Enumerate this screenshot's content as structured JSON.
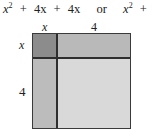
{
  "equation": {
    "term1_base": "x",
    "term1_exp": "2",
    "plus1": "+",
    "term2": "4x",
    "plus2": "+",
    "term3": "4x",
    "connector": "or",
    "alt_term1_base": "x",
    "alt_term1_exp": "2",
    "alt_plus": "+",
    "alt_term2": "8x"
  },
  "top_labels": [
    "x",
    "4"
  ],
  "side_labels": [
    "x",
    "4"
  ],
  "regions": [
    {
      "name": "x-by-x",
      "color": "#8c8c8c"
    },
    {
      "name": "x-by-4",
      "color": "#b9b9b9"
    },
    {
      "name": "4-by-x",
      "color": "#bcbcbc"
    },
    {
      "name": "4-by-4",
      "color": "#d9d9d9"
    }
  ],
  "border_color": "#2e2e2e"
}
